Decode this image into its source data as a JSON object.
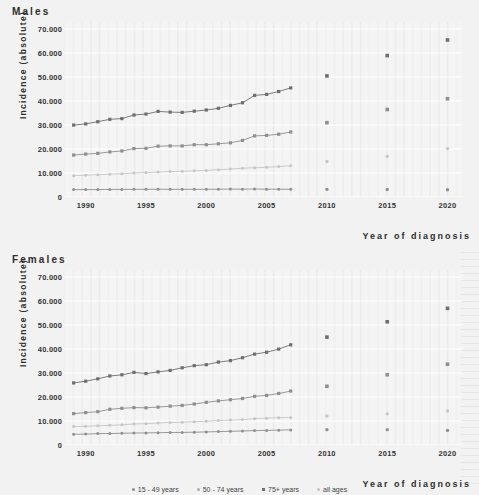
{
  "figure": {
    "xlabel": "Year of diagnosis",
    "ylabel": "Incidence (absolute)",
    "ytick_labels": [
      "0",
      "10.000",
      "20.000",
      "30.000",
      "40.000",
      "50.000",
      "60.000",
      "70.000"
    ],
    "xtick_labels": [
      "1990",
      "1995",
      "2000",
      "2005",
      "2010",
      "2015",
      "2020"
    ],
    "legend": [
      {
        "label": "15 - 49 years",
        "color": "#8c8c8c",
        "marker": "dot"
      },
      {
        "label": "50 - 74 years",
        "color": "#a8a8a8",
        "marker": "dot"
      },
      {
        "label": "75+ years",
        "color": "#6e6e6e",
        "marker": "square"
      },
      {
        "label": "all ages",
        "color": "#c2c2c2",
        "marker": "dot"
      }
    ]
  },
  "chart_data": [
    {
      "type": "line",
      "title": "Males",
      "xlabel": "Year of diagnosis",
      "ylabel": "Incidence (absolute)",
      "xlim": [
        1988.2,
        2021.2
      ],
      "ylim": [
        0,
        73000
      ],
      "yticks": [
        0,
        10000,
        20000,
        30000,
        40000,
        50000,
        60000,
        70000
      ],
      "xticks": [
        1990,
        1995,
        2000,
        2005,
        2010,
        2015,
        2020
      ],
      "grid": "horizontal",
      "legend_position": "bottom-center",
      "x": [
        1989,
        1990,
        1991,
        1992,
        1993,
        1994,
        1995,
        1996,
        1997,
        1998,
        1999,
        2000,
        2001,
        2002,
        2003,
        2004,
        2005,
        2006,
        2007
      ],
      "x_projected": [
        2010,
        2015,
        2020
      ],
      "series": [
        {
          "name": "75+ years",
          "color": "#6e6e6e",
          "marker": "square",
          "values": [
            30000,
            30500,
            31400,
            32400,
            32700,
            34200,
            34600,
            35700,
            35400,
            35300,
            35800,
            36300,
            37000,
            38200,
            39300,
            42400,
            42800,
            44000,
            45500
          ],
          "projected": [
            50500,
            59000,
            65500
          ]
        },
        {
          "name": "50 - 74 years",
          "color": "#8f8f8f",
          "marker": "square",
          "values": [
            17500,
            17900,
            18200,
            18800,
            19200,
            20200,
            20300,
            21200,
            21300,
            21300,
            21800,
            21800,
            22200,
            22600,
            23600,
            25500,
            25700,
            26200,
            27100
          ],
          "projected": [
            31000,
            36500,
            41000
          ]
        },
        {
          "name": "all ages",
          "color": "#c6c6c6",
          "marker": "dot",
          "values": [
            8900,
            9100,
            9300,
            9500,
            9700,
            10000,
            10200,
            10400,
            10600,
            10700,
            10900,
            11100,
            11400,
            11700,
            12000,
            12200,
            12400,
            12700,
            13000
          ],
          "projected": [
            14800,
            17000,
            20200
          ]
        },
        {
          "name": "15 - 49 years",
          "color": "#909090",
          "marker": "dot",
          "values": [
            3100,
            3100,
            3100,
            3150,
            3150,
            3200,
            3200,
            3250,
            3200,
            3200,
            3200,
            3200,
            3250,
            3300,
            3250,
            3350,
            3250,
            3250,
            3200
          ],
          "projected": [
            3200,
            3100,
            3050
          ]
        }
      ]
    },
    {
      "type": "line",
      "title": "Females",
      "xlabel": "Year of diagnosis",
      "ylabel": "Incidence (absolute)",
      "xlim": [
        1988.2,
        2021.2
      ],
      "ylim": [
        0,
        73000
      ],
      "yticks": [
        0,
        10000,
        20000,
        30000,
        40000,
        50000,
        60000,
        70000
      ],
      "xticks": [
        1990,
        1995,
        2000,
        2005,
        2010,
        2015,
        2020
      ],
      "grid": "horizontal",
      "legend_position": "bottom-center",
      "x": [
        1989,
        1990,
        1991,
        1992,
        1993,
        1994,
        1995,
        1996,
        1997,
        1998,
        1999,
        2000,
        2001,
        2002,
        2003,
        2004,
        2005,
        2006,
        2007
      ],
      "x_projected": [
        2010,
        2015,
        2020
      ],
      "series": [
        {
          "name": "75+ years",
          "color": "#6e6e6e",
          "marker": "square",
          "values": [
            25900,
            26600,
            27600,
            28800,
            29300,
            30300,
            29800,
            30500,
            31100,
            32200,
            33100,
            33500,
            34600,
            35200,
            36400,
            37900,
            38700,
            40000,
            41800
          ],
          "projected": [
            45000,
            51400,
            57000
          ]
        },
        {
          "name": "50 - 74 years",
          "color": "#8f8f8f",
          "marker": "square",
          "values": [
            13100,
            13500,
            13900,
            14900,
            15300,
            15600,
            15500,
            15800,
            16200,
            16500,
            17100,
            17800,
            18400,
            18900,
            19400,
            20300,
            20700,
            21500,
            22500
          ],
          "projected": [
            24500,
            29300,
            33700
          ]
        },
        {
          "name": "all ages",
          "color": "#c6c6c6",
          "marker": "dot",
          "values": [
            7700,
            7800,
            8000,
            8200,
            8400,
            8800,
            8900,
            9200,
            9400,
            9500,
            9700,
            9900,
            10200,
            10400,
            10600,
            11000,
            11200,
            11400,
            11500
          ],
          "projected": [
            12100,
            13000,
            14200
          ]
        },
        {
          "name": "15 - 49 years",
          "color": "#909090",
          "marker": "dot",
          "values": [
            4500,
            4550,
            4750,
            4800,
            4900,
            5000,
            5050,
            5150,
            5200,
            5250,
            5350,
            5450,
            5600,
            5700,
            5850,
            6000,
            6100,
            6200,
            6300
          ],
          "projected": [
            6400,
            6400,
            6100
          ]
        }
      ]
    }
  ]
}
